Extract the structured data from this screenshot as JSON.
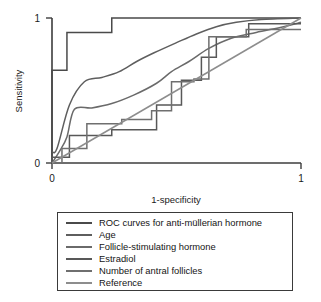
{
  "chart_data": {
    "type": "line",
    "title": "",
    "xlabel": "1-specificity",
    "ylabel": "Sensitivity",
    "xlim": [
      0,
      1
    ],
    "ylim": [
      0,
      1
    ],
    "xticks": [
      "0",
      "1"
    ],
    "yticks": [
      "0",
      "1"
    ],
    "grid": false,
    "legend_position": "below-plot",
    "series": [
      {
        "name": "ROC curves for anti-müllerian hormone",
        "color": "#4a4a4a",
        "style": "step",
        "x": [
          0.0,
          0.0,
          0.06,
          0.06,
          0.24,
          0.24,
          0.68,
          0.68,
          1.0
        ],
        "y": [
          0.0,
          0.64,
          0.64,
          0.9,
          0.9,
          1.0,
          1.0,
          1.0,
          1.0
        ]
      },
      {
        "name": "Age",
        "color": "#5e5e5e",
        "style": "smooth",
        "x": [
          0.0,
          0.02,
          0.07,
          0.13,
          0.2,
          0.27,
          0.34,
          0.41,
          0.5,
          0.58,
          0.66,
          0.74,
          0.84,
          1.0
        ],
        "y": [
          0.08,
          0.1,
          0.4,
          0.56,
          0.59,
          0.63,
          0.7,
          0.76,
          0.83,
          0.89,
          0.94,
          0.97,
          0.99,
          1.0
        ]
      },
      {
        "name": "Follicle-stimulating hormone",
        "color": "#6a6a6a",
        "style": "smooth",
        "x": [
          0.0,
          0.03,
          0.06,
          0.09,
          0.16,
          0.24,
          0.33,
          0.42,
          0.48,
          0.55,
          0.63,
          0.72,
          0.82,
          0.93,
          1.0
        ],
        "y": [
          0.0,
          0.08,
          0.18,
          0.37,
          0.38,
          0.41,
          0.47,
          0.55,
          0.63,
          0.7,
          0.79,
          0.86,
          0.9,
          0.94,
          0.97
        ]
      },
      {
        "name": "Estradiol",
        "color": "#585858",
        "style": "step",
        "x": [
          0.0,
          0.0,
          0.07,
          0.07,
          0.24,
          0.24,
          0.42,
          0.42,
          0.52,
          0.52,
          0.6,
          0.6,
          0.66,
          0.66,
          0.79,
          0.79,
          1.0
        ],
        "y": [
          0.0,
          0.04,
          0.04,
          0.19,
          0.19,
          0.23,
          0.23,
          0.4,
          0.4,
          0.57,
          0.57,
          0.73,
          0.73,
          0.87,
          0.87,
          0.96,
          0.96
        ]
      },
      {
        "name": "Number of antral follicles",
        "color": "#6f6f6f",
        "style": "step",
        "x": [
          0.0,
          0.04,
          0.04,
          0.14,
          0.14,
          0.28,
          0.28,
          0.4,
          0.4,
          0.48,
          0.48,
          0.57,
          0.57,
          0.63,
          0.63,
          0.78,
          0.78,
          1.0
        ],
        "y": [
          0.0,
          0.0,
          0.1,
          0.1,
          0.27,
          0.27,
          0.3,
          0.3,
          0.36,
          0.36,
          0.56,
          0.56,
          0.58,
          0.58,
          0.87,
          0.87,
          0.92,
          0.92
        ]
      },
      {
        "name": "Reference",
        "color": "#8d8d8d",
        "style": "diagonal",
        "x": [
          0.0,
          1.0
        ],
        "y": [
          0.0,
          1.0
        ]
      }
    ]
  },
  "legend": {
    "items": [
      {
        "label": "ROC curves for anti-müllerian hormone",
        "color": "#4a4a4a"
      },
      {
        "label": "Age",
        "color": "#5e5e5e"
      },
      {
        "label": "Follicle-stimulating hormone",
        "color": "#6a6a6a"
      },
      {
        "label": "Estradiol",
        "color": "#585858"
      },
      {
        "label": "Number of antral follicles",
        "color": "#6f6f6f"
      },
      {
        "label": "Reference",
        "color": "#8d8d8d"
      }
    ]
  },
  "axes": {
    "x_label": "1-specificity",
    "y_label": "Sensitivity",
    "x_tick_min": "0",
    "x_tick_max": "1",
    "y_tick_min": "0",
    "y_tick_max": "1"
  }
}
